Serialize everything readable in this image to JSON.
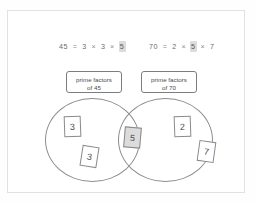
{
  "frame": {
    "border_color": "#e2e2e2",
    "background": "#ffffff"
  },
  "equations": {
    "left": {
      "product": "45",
      "equals": "=",
      "factor1": "3",
      "op1": "×",
      "factor2": "3",
      "op2": "×",
      "factor3": "5",
      "highlighted_factor": "5",
      "full_text": "45 = 3 × 3 × 5"
    },
    "right": {
      "product": "70",
      "equals": "=",
      "factor1": "2",
      "op1": "×",
      "factor2": "5",
      "op2": "×",
      "factor3": "7",
      "highlighted_factor": "5",
      "full_text": "70 = 2 × 5 × 7"
    },
    "highlight_color": "#dcdcdc"
  },
  "labels": {
    "left": {
      "line1": "prime factors",
      "line2": "of 45"
    },
    "right": {
      "line1": "prime factors",
      "line2": "of 70"
    }
  },
  "venn": {
    "left_set_name": "prime factors of 45",
    "right_set_name": "prime factors of 70",
    "stroke_color": "#8d8d8d",
    "cards": [
      {
        "id": "card-3a",
        "value": "3",
        "region": "left-only",
        "shaded": false
      },
      {
        "id": "card-3b",
        "value": "3",
        "region": "left-only",
        "shaded": false
      },
      {
        "id": "card-5",
        "value": "5",
        "region": "intersection",
        "shaded": true
      },
      {
        "id": "card-2",
        "value": "2",
        "region": "right-only",
        "shaded": false
      },
      {
        "id": "card-7",
        "value": "7",
        "region": "right-only",
        "shaded": false
      }
    ],
    "card_shade_color": "#dcdcdc"
  }
}
